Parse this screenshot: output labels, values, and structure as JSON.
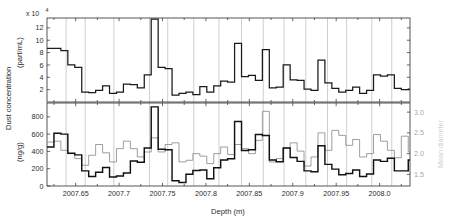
{
  "figure": {
    "title": "",
    "exponent_label": "x 10",
    "exponent_power": "4",
    "xlabel": "Depth (m)",
    "ylabel_main": "Dust concentration",
    "ylabel_top_units": "(part/mL)",
    "ylabel_bottom_units": "(ng/g)",
    "ylabel_right": "Mean diameter"
  },
  "axes": {
    "x_ticks": [
      "2007.65",
      "2007.7",
      "2007.75",
      "2007.8",
      "2007.85",
      "2007.9",
      "2007.95",
      "2008.0"
    ],
    "x_tick_values": [
      2007.65,
      2007.7,
      2007.75,
      2007.8,
      2007.85,
      2007.9,
      2007.95,
      2008.0
    ],
    "x_range": [
      2007.617,
      2008.035
    ],
    "top_y_ticks": [
      "2",
      "4",
      "6",
      "8",
      "10",
      "12"
    ],
    "top_y_tick_values": [
      2,
      4,
      6,
      8,
      10,
      12
    ],
    "top_y_range": [
      0,
      13.6
    ],
    "bottom_y_ticks": [
      "0",
      "200",
      "400",
      "600",
      "800"
    ],
    "bottom_y_tick_values": [
      0,
      200,
      400,
      600,
      800
    ],
    "bottom_y_range": [
      0,
      960
    ],
    "right_y_ticks": [
      "1.5",
      "2.0",
      "2.5",
      "3.0"
    ],
    "right_y_tick_values": [
      1.5,
      2.0,
      2.5,
      3.0
    ],
    "right_y_range": [
      1.22,
      3.22
    ],
    "grid": "vertical-annual-layer-markers"
  },
  "colors": {
    "axis": "#2b2b2b",
    "gridline": "#c9c9c9",
    "trace_concentration": "#1a1a1a",
    "trace_mass": "#111111",
    "trace_diameter": "#8c8c8c",
    "background": "#ffffff"
  },
  "chart_data": {
    "type": "line",
    "title": "",
    "xlabel": "Depth (m)",
    "ylabel": "Dust concentration",
    "grid": true,
    "legend_position": "none",
    "panels": [
      {
        "name": "top",
        "ylabel": "Dust concentration (part/mL)",
        "y_scale_factor": 10000,
        "ylim": [
          0,
          13.6
        ],
        "step_style": "post",
        "series": [
          {
            "name": "particle concentration",
            "units": "part/mL (x10^4)",
            "axis": "left",
            "x": [
              2007.617,
              2007.625,
              2007.633,
              2007.641,
              2007.649,
              2007.657,
              2007.665,
              2007.673,
              2007.681,
              2007.689,
              2007.697,
              2007.705,
              2007.713,
              2007.721,
              2007.729,
              2007.737,
              2007.745,
              2007.753,
              2007.761,
              2007.769,
              2007.777,
              2007.785,
              2007.793,
              2007.801,
              2007.809,
              2007.817,
              2007.825,
              2007.833,
              2007.841,
              2007.849,
              2007.857,
              2007.865,
              2007.873,
              2007.881,
              2007.889,
              2007.897,
              2007.905,
              2007.913,
              2007.921,
              2007.929,
              2007.937,
              2007.945,
              2007.953,
              2007.961,
              2007.969,
              2007.977,
              2007.985,
              2007.993,
              2008.001,
              2008.009,
              2008.017,
              2008.025,
              2008.033
            ],
            "values": [
              8.7,
              8.7,
              8.3,
              6.0,
              5.6,
              1.6,
              1.5,
              1.9,
              2.6,
              1.4,
              1.6,
              2.9,
              2.8,
              2.3,
              4.4,
              13.4,
              5.6,
              5.4,
              1.1,
              1.4,
              1.6,
              1.2,
              2.5,
              1.6,
              2.6,
              3.4,
              3.2,
              9.5,
              4.1,
              4.3,
              3.5,
              8.5,
              2.3,
              2.4,
              6.0,
              3.6,
              3.5,
              2.1,
              1.9,
              6.8,
              3.1,
              2.2,
              1.6,
              1.9,
              2.4,
              1.4,
              1.9,
              4.4,
              4.2,
              4.4,
              2.2,
              2.0,
              2.1
            ]
          }
        ]
      },
      {
        "name": "bottom",
        "ylabel": "Dust concentration (ng/g)",
        "ylabel_right": "Mean diameter",
        "ylim": [
          0,
          960
        ],
        "ylim_right": [
          1.22,
          3.22
        ],
        "step_style": "post",
        "series": [
          {
            "name": "dust mass concentration",
            "units": "ng/g",
            "axis": "left",
            "x": [
              2007.617,
              2007.625,
              2007.633,
              2007.641,
              2007.649,
              2007.657,
              2007.665,
              2007.673,
              2007.681,
              2007.689,
              2007.697,
              2007.705,
              2007.713,
              2007.721,
              2007.729,
              2007.737,
              2007.745,
              2007.753,
              2007.761,
              2007.769,
              2007.777,
              2007.785,
              2007.793,
              2007.801,
              2007.809,
              2007.817,
              2007.825,
              2007.833,
              2007.841,
              2007.849,
              2007.857,
              2007.865,
              2007.873,
              2007.881,
              2007.889,
              2007.897,
              2007.905,
              2007.913,
              2007.921,
              2007.929,
              2007.937,
              2007.945,
              2007.953,
              2007.961,
              2007.969,
              2007.977,
              2007.985,
              2007.993,
              2008.001,
              2008.009,
              2008.017,
              2008.025,
              2008.033
            ],
            "values": [
              450,
              610,
              600,
              380,
              360,
              175,
              110,
              160,
              215,
              105,
              115,
              150,
              290,
              275,
              440,
              915,
              425,
              420,
              60,
              40,
              135,
              180,
              185,
              85,
              210,
              300,
              315,
              745,
              410,
              420,
              595,
              585,
              300,
              280,
              440,
              330,
              285,
              175,
              165,
              465,
              250,
              195,
              130,
              145,
              185,
              110,
              140,
              300,
              285,
              320,
              175,
              175,
              300
            ],
            "style": "bold"
          },
          {
            "name": "mean grain diameter",
            "units": "um",
            "axis": "right",
            "x": [
              2007.617,
              2007.625,
              2007.633,
              2007.641,
              2007.649,
              2007.657,
              2007.665,
              2007.673,
              2007.681,
              2007.689,
              2007.697,
              2007.705,
              2007.713,
              2007.721,
              2007.729,
              2007.737,
              2007.745,
              2007.753,
              2007.761,
              2007.769,
              2007.777,
              2007.785,
              2007.793,
              2007.801,
              2007.809,
              2007.817,
              2007.825,
              2007.833,
              2007.841,
              2007.849,
              2007.857,
              2007.865,
              2007.873,
              2007.881,
              2007.889,
              2007.897,
              2007.905,
              2007.913,
              2007.921,
              2007.929,
              2007.937,
              2007.945,
              2007.953,
              2007.961,
              2007.969,
              2007.977,
              2007.985,
              2007.993,
              2008.001,
              2008.009,
              2008.017,
              2008.025,
              2008.033
            ],
            "values": [
              2.28,
              2.3,
              2.08,
              2.0,
              1.88,
              1.72,
              1.96,
              2.22,
              2.02,
              1.8,
              2.12,
              2.3,
              2.12,
              1.92,
              2.04,
              2.38,
              2.04,
              2.22,
              2.26,
              1.8,
              1.84,
              2.0,
              1.94,
              1.76,
              2.0,
              2.16,
              1.98,
              2.22,
              2.12,
              2.0,
              2.32,
              3.02,
              1.8,
              1.88,
              2.14,
              2.26,
              2.06,
              1.7,
              1.92,
              2.5,
              2.08,
              2.56,
              2.44,
              2.2,
              2.34,
              1.92,
              2.0,
              2.46,
              2.3,
              2.08,
              1.9,
              2.42,
              2.04
            ],
            "style": "light"
          }
        ]
      }
    ],
    "annual_layer_markers": [
      2007.639,
      2007.661,
      2007.694,
      2007.735,
      2007.756,
      2007.786,
      2007.815,
      2007.841,
      2007.866,
      2007.89,
      2007.915,
      2007.94,
      2007.962,
      2007.991,
      2008.014
    ]
  }
}
